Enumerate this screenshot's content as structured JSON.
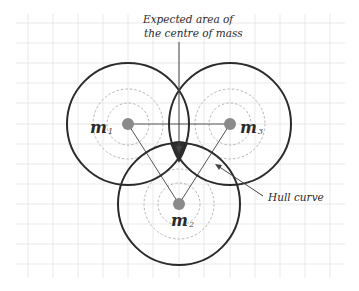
{
  "diagram": {
    "colors": {
      "background": "#ffffff",
      "grid": "#e3e3e3",
      "outer_circle": "#2b2b2b",
      "dashed_circle": "#b5b5b5",
      "mass_dot": "#8a8a8a",
      "connector": "#555555",
      "centre_area": "#2f2f2f"
    },
    "annotations": {
      "top_line1": "Expected area  of",
      "top_line2": "the centre of mass",
      "hull": "Hull curve"
    },
    "masses": [
      {
        "id": "m1",
        "symbol": "m",
        "subscript": "1"
      },
      {
        "id": "m2",
        "symbol": "m",
        "subscript": "2"
      },
      {
        "id": "m3",
        "symbol": "m",
        "subscript": "3"
      }
    ]
  }
}
